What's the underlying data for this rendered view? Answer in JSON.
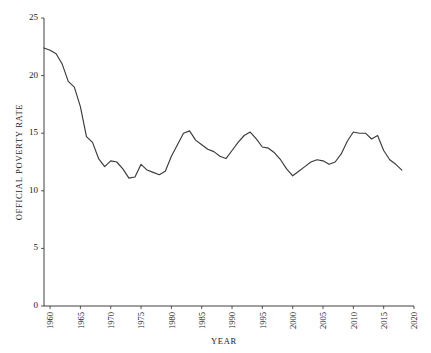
{
  "chart_data": {
    "type": "line",
    "title": "",
    "xlabel": "YEAR",
    "ylabel": "OFFICIAL POVERTY RATE",
    "xlim": [
      1959,
      2020
    ],
    "ylim": [
      0,
      25
    ],
    "grid": false,
    "legend": "none",
    "line_color": "#3a3a3a",
    "xticks": [
      1960,
      1965,
      1970,
      1975,
      1980,
      1985,
      1990,
      1995,
      2000,
      2005,
      2010,
      2015,
      2020
    ],
    "xtick_labels": [
      "1960",
      "1965",
      "1970",
      "1975",
      "1980",
      "1985",
      "1990",
      "1995",
      "2000",
      "2005",
      "2010",
      "2015",
      "2020"
    ],
    "yticks": [
      0,
      5,
      10,
      15,
      20,
      25
    ],
    "ytick_labels": [
      "0",
      "5",
      "10",
      "15",
      "20",
      "25"
    ],
    "x": [
      1959,
      1960,
      1961,
      1962,
      1963,
      1964,
      1965,
      1966,
      1967,
      1968,
      1969,
      1970,
      1971,
      1972,
      1973,
      1974,
      1975,
      1976,
      1977,
      1978,
      1979,
      1980,
      1981,
      1982,
      1983,
      1984,
      1985,
      1986,
      1987,
      1988,
      1989,
      1990,
      1991,
      1992,
      1993,
      1994,
      1995,
      1996,
      1997,
      1998,
      1999,
      2000,
      2001,
      2002,
      2003,
      2004,
      2005,
      2006,
      2007,
      2008,
      2009,
      2010,
      2011,
      2012,
      2013,
      2014,
      2015,
      2016,
      2017,
      2018
    ],
    "values": [
      22.4,
      22.2,
      21.9,
      21.0,
      19.5,
      19.0,
      17.3,
      14.7,
      14.2,
      12.8,
      12.1,
      12.6,
      12.5,
      11.9,
      11.1,
      11.2,
      12.3,
      11.8,
      11.6,
      11.4,
      11.7,
      13.0,
      14.0,
      15.0,
      15.2,
      14.4,
      14.0,
      13.6,
      13.4,
      13.0,
      12.8,
      13.5,
      14.2,
      14.8,
      15.1,
      14.5,
      13.8,
      13.7,
      13.3,
      12.7,
      11.9,
      11.3,
      11.7,
      12.1,
      12.5,
      12.7,
      12.6,
      12.3,
      12.5,
      13.2,
      14.3,
      15.1,
      15.0,
      15.0,
      14.5,
      14.8,
      13.5,
      12.7,
      12.3,
      11.8
    ],
    "series": [
      {
        "name": "Official Poverty Rate",
        "values": [
          22.4,
          22.2,
          21.9,
          21.0,
          19.5,
          19.0,
          17.3,
          14.7,
          14.2,
          12.8,
          12.1,
          12.6,
          12.5,
          11.9,
          11.1,
          11.2,
          12.3,
          11.8,
          11.6,
          11.4,
          11.7,
          13.0,
          14.0,
          15.0,
          15.2,
          14.4,
          14.0,
          13.6,
          13.4,
          13.0,
          12.8,
          13.5,
          14.2,
          14.8,
          15.1,
          14.5,
          13.8,
          13.7,
          13.3,
          12.7,
          11.9,
          11.3,
          11.7,
          12.1,
          12.5,
          12.7,
          12.6,
          12.3,
          12.5,
          13.2,
          14.3,
          15.1,
          15.0,
          15.0,
          14.5,
          14.8,
          13.5,
          12.7,
          12.3,
          11.8
        ]
      }
    ]
  }
}
